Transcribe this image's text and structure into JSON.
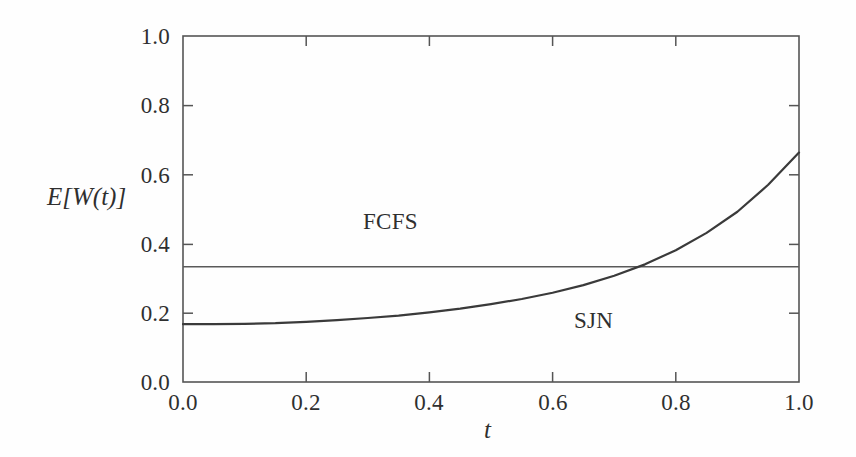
{
  "chart_data": {
    "type": "line",
    "title": "",
    "subtitle": "",
    "xlabel": "t",
    "ylabel": "E[W(t)]",
    "xlim": [
      0.0,
      1.0
    ],
    "ylim": [
      0.0,
      1.0
    ],
    "grid": false,
    "legend_position": "inline-annotation",
    "xticks": [
      0.0,
      0.2,
      0.4,
      0.6,
      0.8,
      1.0
    ],
    "xtick_labels": [
      "0.0",
      "0.2",
      "0.4",
      "0.6",
      "0.8",
      "1.0"
    ],
    "yticks": [
      0.0,
      0.2,
      0.4,
      0.6,
      0.8,
      1.0
    ],
    "ytick_labels": [
      "0.0",
      "0.2",
      "0.4",
      "0.6",
      "0.8",
      "1.0"
    ],
    "x": [
      0.0,
      0.05,
      0.1,
      0.15,
      0.2,
      0.25,
      0.3,
      0.35,
      0.4,
      0.45,
      0.5,
      0.55,
      0.6,
      0.65,
      0.7,
      0.75,
      0.8,
      0.85,
      0.9,
      0.95,
      1.0
    ],
    "series": [
      {
        "name": "FCFS",
        "values": [
          0.333,
          0.333,
          0.333,
          0.333,
          0.333,
          0.333,
          0.333,
          0.333,
          0.333,
          0.333,
          0.333,
          0.333,
          0.333,
          0.333,
          0.333,
          0.333,
          0.333,
          0.333,
          0.333,
          0.333,
          0.333
        ],
        "color": "#5a5a5a",
        "label_x": 0.32,
        "label_y": 0.44
      },
      {
        "name": "SJN",
        "values": [
          0.167,
          0.167,
          0.168,
          0.17,
          0.174,
          0.179,
          0.185,
          0.192,
          0.201,
          0.212,
          0.225,
          0.24,
          0.258,
          0.28,
          0.307,
          0.34,
          0.381,
          0.431,
          0.492,
          0.57,
          0.663
        ],
        "color": "#3a3a3a",
        "label_x": 0.64,
        "label_y": 0.175
      }
    ],
    "annotations": [
      {
        "text": "FCFS",
        "x": 0.32,
        "y": 0.44
      },
      {
        "text": "SJN",
        "x": 0.64,
        "y": 0.175
      }
    ],
    "crossover": {
      "x": 0.77,
      "y": 0.333
    }
  },
  "axes": {
    "y_tick_labels": [
      "1.0",
      "0.8",
      "0.6",
      "0.4",
      "0.2",
      "0.0"
    ],
    "x_tick_labels": [
      "0.0",
      "0.2",
      "0.4",
      "0.6",
      "0.8",
      "1.0"
    ],
    "y_axis_title": "E[W(t)]",
    "x_axis_title": "t"
  },
  "labels": {
    "fcfs": "FCFS",
    "sjn": "SJN"
  },
  "colors": {
    "background": "#fefefe",
    "frame": "#555555",
    "fcfs_line": "#5a5a5a",
    "sjn_line": "#3a3a3a",
    "text": "#2f2f2f"
  }
}
